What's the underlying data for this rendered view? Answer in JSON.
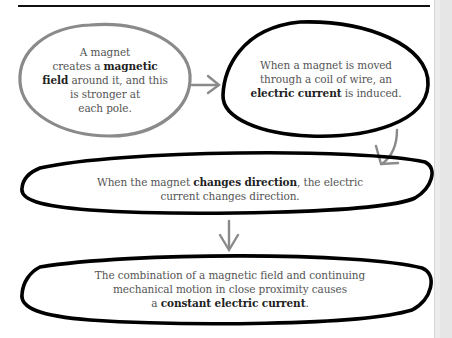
{
  "diagram": {
    "nodes": [
      {
        "id": "magnet-field",
        "lines": [
          [
            {
              "t": "A magnet",
              "b": false
            }
          ],
          [
            {
              "t": "creates a ",
              "b": false
            },
            {
              "t": "magnetic",
              "b": true
            }
          ],
          [
            {
              "t": "field",
              "b": true
            },
            {
              "t": " around it, and this",
              "b": false
            }
          ],
          [
            {
              "t": "is stronger at",
              "b": false
            }
          ],
          [
            {
              "t": "each pole.",
              "b": false
            }
          ]
        ],
        "border_color": "#8a8a8a"
      },
      {
        "id": "induced-current",
        "lines": [
          [
            {
              "t": "When a magnet is moved",
              "b": false
            }
          ],
          [
            {
              "t": "through a coil of wire, an",
              "b": false
            }
          ],
          [
            {
              "t": "electric current",
              "b": true
            },
            {
              "t": " is induced.",
              "b": false
            }
          ]
        ],
        "border_color": "#000000"
      },
      {
        "id": "direction-change",
        "lines": [
          [
            {
              "t": "When the magnet ",
              "b": false
            },
            {
              "t": "changes direction",
              "b": true
            },
            {
              "t": ", the electric",
              "b": false
            }
          ],
          [
            {
              "t": "current changes direction.",
              "b": false
            }
          ]
        ],
        "border_color": "#000000"
      },
      {
        "id": "constant-current",
        "lines": [
          [
            {
              "t": "The combination of a magnetic field and continuing",
              "b": false
            }
          ],
          [
            {
              "t": "mechanical motion in close proximity causes",
              "b": false
            }
          ],
          [
            {
              "t": "a ",
              "b": false
            },
            {
              "t": "constant electric current",
              "b": true
            },
            {
              "t": ".",
              "b": false
            }
          ]
        ],
        "border_color": "#000000"
      }
    ],
    "arrows": [
      {
        "from": "magnet-field",
        "to": "induced-current",
        "direction": "right",
        "color": "#8a8a8a"
      },
      {
        "from": "induced-current",
        "to": "direction-change",
        "direction": "down-curved",
        "color": "#8a8a8a"
      },
      {
        "from": "direction-change",
        "to": "constant-current",
        "direction": "down",
        "color": "#8a8a8a"
      }
    ]
  }
}
